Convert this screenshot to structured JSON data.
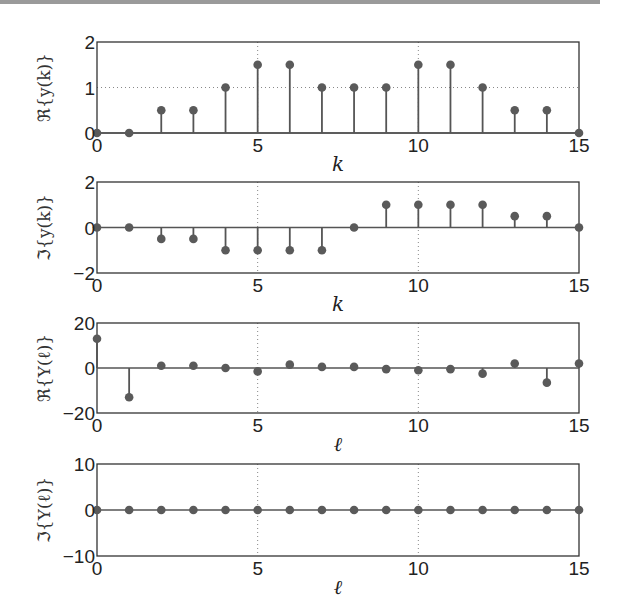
{
  "chart_data": [
    {
      "type": "stem",
      "title": "",
      "xlabel": "k",
      "ylabel": "ℜ{y(k)}",
      "x": [
        0,
        1,
        2,
        3,
        4,
        5,
        6,
        7,
        8,
        9,
        10,
        11,
        12,
        13,
        14,
        15
      ],
      "values": [
        0,
        0,
        0.5,
        0.5,
        1,
        1.5,
        1.5,
        1,
        1,
        1,
        1.5,
        1.5,
        1,
        0.5,
        0.5,
        0
      ],
      "xlim": [
        0,
        15
      ],
      "ylim": [
        0,
        2
      ],
      "xticks": [
        "0",
        "5",
        "10",
        "15"
      ],
      "yticks": [
        "0",
        "1",
        "2"
      ],
      "grid": "dotted at x=5,10 and y=1"
    },
    {
      "type": "stem",
      "title": "",
      "xlabel": "k",
      "ylabel": "ℑ{y(k)}",
      "x": [
        0,
        1,
        2,
        3,
        4,
        5,
        6,
        7,
        8,
        9,
        10,
        11,
        12,
        13,
        14,
        15
      ],
      "values": [
        0,
        0,
        -0.5,
        -0.5,
        -1,
        -1,
        -1,
        -1,
        0,
        1,
        1,
        1,
        1,
        0.5,
        0.5,
        0
      ],
      "xlim": [
        0,
        15
      ],
      "ylim": [
        -2,
        2
      ],
      "xticks": [
        "0",
        "5",
        "10",
        "15"
      ],
      "yticks": [
        "-2",
        "0",
        "2"
      ],
      "grid": "dotted at x=5,10"
    },
    {
      "type": "stem",
      "title": "",
      "xlabel": "ℓ",
      "ylabel": "ℜ{Y(ℓ)}",
      "x": [
        0,
        1,
        2,
        3,
        4,
        5,
        6,
        7,
        8,
        9,
        10,
        11,
        12,
        13,
        14,
        15
      ],
      "values": [
        13,
        -13,
        1,
        1,
        0,
        -1.5,
        1.5,
        0.5,
        0.5,
        -0.5,
        -1,
        -0.5,
        -2.5,
        2,
        -6.5,
        2
      ],
      "xlim": [
        0,
        15
      ],
      "ylim": [
        -20,
        20
      ],
      "xticks": [
        "0",
        "5",
        "10",
        "15"
      ],
      "yticks": [
        "-20",
        "0",
        "20"
      ],
      "grid": "dotted at x=5,10"
    },
    {
      "type": "stem",
      "title": "",
      "xlabel": "ℓ",
      "ylabel": "ℑ{Y(ℓ)}",
      "x": [
        0,
        1,
        2,
        3,
        4,
        5,
        6,
        7,
        8,
        9,
        10,
        11,
        12,
        13,
        14,
        15
      ],
      "values": [
        0,
        0,
        0,
        0,
        0,
        0,
        0,
        0,
        0,
        0,
        0,
        0,
        0,
        0,
        0,
        0
      ],
      "xlim": [
        0,
        15
      ],
      "ylim": [
        -10,
        10
      ],
      "xticks": [
        "0",
        "5",
        "10",
        "15"
      ],
      "yticks": [
        "-10",
        "0",
        "10"
      ],
      "grid": "dotted at x=5,10"
    }
  ],
  "style": {
    "stem_color": "#555555",
    "marker_color": "#5a5a5a",
    "axis_color": "#333333",
    "grid_color": "#888888"
  }
}
